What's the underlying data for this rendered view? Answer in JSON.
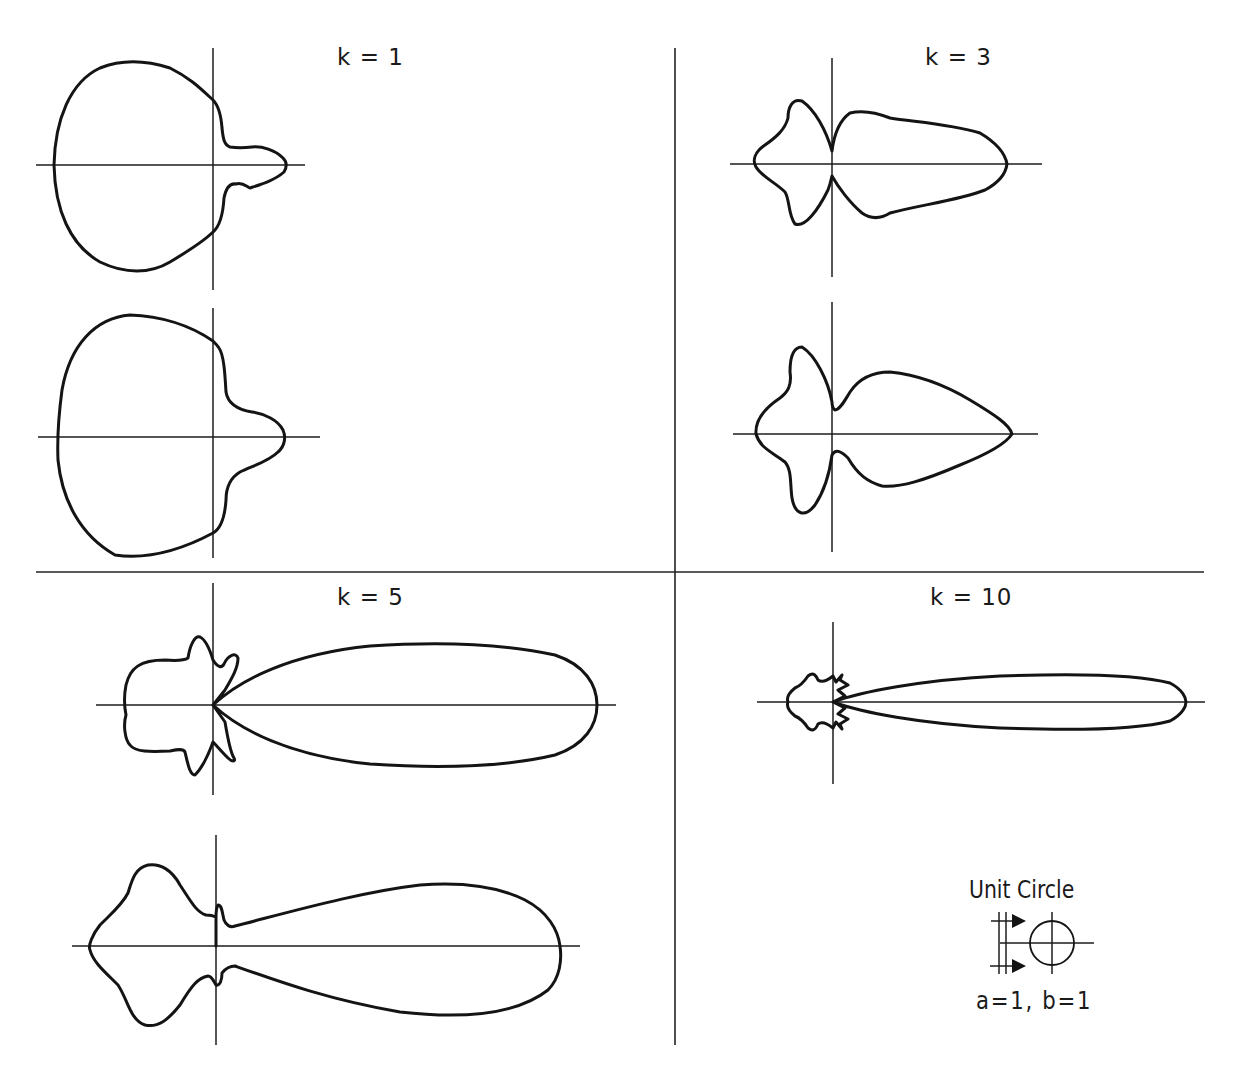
{
  "figure": {
    "panels": [
      {
        "id": "k1",
        "label": "k = 1",
        "label_pos": [
          337,
          44
        ],
        "plots": [
          {
            "origin": [
              213,
              165
            ],
            "axis_h": [
              36,
              305
            ],
            "axis_v": [
              48,
              290
            ],
            "path": "M 213 100 C 200 88 190 78 170 68 C 145 60 120 60 100 68 C 70 82 55 120 54 165 C 55 210 70 245 100 262 C 125 274 150 274 170 262 C 190 250 205 240 213 232 C 220 226 223 215 224 198 C 226 188 230 183 236 184 C 242 182 246 186 250 188 C 262 184 275 180 284 172 C 287 167 287 162 283 158 C 275 150 262 146 252 147 C 244 148 236 148 230 147 C 224 145 223 138 222 128 C 221 115 218 105 213 100 Z"
          },
          {
            "origin": [
              213,
              437
            ],
            "axis_h": [
              38,
              320
            ],
            "axis_v": [
              308,
              558
            ],
            "path": "M 213 341 C 190 325 160 316 130 315 C 95 318 70 345 62 390 C 58 420 57 437 58 460 C 62 500 80 535 115 555 C 150 560 185 548 213 533 C 222 528 225 515 226 500 C 226 488 230 478 240 472 C 252 466 268 462 278 452 C 285 446 286 437 283 430 C 278 420 265 414 252 412 C 240 410 228 405 226 392 C 225 375 224 355 219 348 C 217 345 215 343 213 341 Z"
          }
        ]
      },
      {
        "id": "k3",
        "label": "k = 3",
        "label_pos": [
          925,
          44
        ],
        "plots": [
          {
            "origin": [
              832,
              164
            ],
            "axis_h": [
              730,
              1042
            ],
            "axis_v": [
              58,
              277
            ],
            "path": "M 832 151 C 826 130 815 110 802 101 C 792 98 788 108 788 118 C 785 130 775 138 765 145 C 755 152 752 160 756 167 C 762 177 775 182 785 192 C 790 200 788 215 795 224 C 805 228 818 210 828 190 C 831 182 832 175 832 176 C 838 187 850 203 862 213 C 872 220 882 218 890 213 C 920 205 960 200 985 190 C 1000 182 1006 172 1007 164 C 1005 152 995 142 980 133 C 950 124 915 122 890 118 C 875 112 862 110 850 113 C 840 120 834 135 832 151 Z"
          },
          {
            "origin": [
              832,
              434
            ],
            "axis_h": [
              733,
              1038
            ],
            "axis_v": [
              302,
              552
            ],
            "path": "M 832 402 C 828 380 815 355 802 347 C 792 347 790 360 790 372 C 792 385 788 392 780 398 C 765 408 755 420 756 434 C 760 448 772 452 785 462 C 792 470 790 485 792 498 C 795 515 805 518 815 505 C 825 490 830 470 832 455 C 836 448 842 452 848 458 C 858 475 868 482 882 486 C 900 488 925 480 960 465 C 985 455 1005 445 1012 434 C 1010 425 995 415 970 400 C 945 385 920 375 890 372 C 870 372 858 380 850 392 C 845 400 840 410 835 410 C 832 408 832 405 832 402 Z"
          }
        ]
      },
      {
        "id": "k5",
        "label": "k = 5",
        "label_pos": [
          337,
          584
        ],
        "plots": [
          {
            "origin": [
              213,
              705
            ],
            "axis_h": [
              96,
              616
            ],
            "axis_v": [
              583,
              795
            ],
            "path": "M 213 705 C 240 680 290 654 370 646 C 430 642 500 643 555 655 C 585 665 597 685 597 705 C 597 725 585 745 555 755 C 500 768 430 768 370 764 C 290 756 240 730 213 705 L 225 722 C 228 740 232 755 234 758 C 236 762 232 762 228 758 C 222 752 216 745 213 742 C 210 750 205 765 195 775 C 190 775 188 765 185 752 C 183 748 175 750 170 751 C 150 752 135 752 130 745 C 125 740 123 725 126 715 C 124 705 124 695 126 685 C 130 668 140 660 165 660 C 178 661 185 660 188 658 C 190 645 195 635 200 637 C 206 640 210 650 213 660 C 218 668 222 668 224 664 C 228 655 236 652 238 658 C 238 668 232 678 225 690 L 213 705 Z"
          },
          {
            "origin": [
              216,
              946
            ],
            "axis_h": [
              72,
              580
            ],
            "axis_v": [
              835,
              1045
            ],
            "path": "M 216 946 L 216 917 C 212 915 210 915 206 915 C 196 912 190 900 180 885 C 172 870 160 863 148 865 C 135 868 132 880 128 893 C 122 905 110 915 100 925 C 92 935 88 946 90 950 C 93 962 105 972 118 985 C 128 1000 130 1020 145 1025 C 158 1028 168 1020 180 1005 C 192 985 198 978 208 976 C 212 976 214 982 216 985 C 220 986 222 980 222 973 C 226 968 230 966 235 966 C 280 982 330 1000 400 1012 C 470 1020 520 1012 548 990 C 560 978 562 960 560 946 C 558 930 548 912 525 900 C 495 885 460 882 420 885 C 360 892 290 912 235 926 C 230 928 226 925 224 920 C 222 912 222 905 218 905 C 216 908 216 912 216 917"
          }
        ]
      },
      {
        "id": "k10",
        "label": "k = 10",
        "label_pos": [
          930,
          584
        ],
        "plots": [
          {
            "origin": [
              833,
              702
            ],
            "axis_h": [
              757,
              1205
            ],
            "axis_v": [
              622,
              784
            ],
            "path": "M 833 702 C 860 692 920 680 1000 676 C 1080 673 1140 675 1170 683 C 1183 690 1186 698 1186 702 C 1186 706 1183 714 1170 721 C 1140 729 1080 731 1000 728 C 920 724 860 712 833 702 L 845 696 L 838 690 L 848 685 L 840 680 L 842 675 L 836 682 L 833 676 C 828 680 822 683 818 680 C 815 673 812 673 808 676 C 804 682 800 686 795 688 C 790 692 786 697 788 702 C 786 707 790 712 795 716 C 800 718 804 722 808 728 C 812 731 815 731 818 724 C 822 721 828 724 833 728 L 836 722 L 842 729 L 840 724 L 848 719 L 838 714 L 845 708 L 833 702 Z"
          }
        ]
      }
    ],
    "dividers": {
      "horizontal": {
        "y": 572,
        "x1": 36,
        "x2": 1204
      },
      "vertical": {
        "x": 675,
        "y1": 48,
        "y2": 1045
      }
    },
    "legend": {
      "title": "Unit Circle",
      "params": "a=1, b=1",
      "icon": "unit-circle-with-plane-wave-arrows",
      "circle_center": [
        1052,
        943
      ],
      "circle_radius": 22
    }
  },
  "colors": {
    "background": "#ffffff",
    "ink": "#141414"
  }
}
